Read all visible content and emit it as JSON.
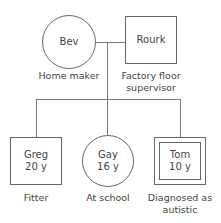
{
  "parents": [
    {
      "name": "Bev",
      "shape": "circle",
      "role": "Home maker",
      "role_lines": [
        "Home maker"
      ]
    },
    {
      "name": "Rourk",
      "shape": "square",
      "role": "Factory floor supervisor",
      "role_lines": [
        "Factory floor",
        "supervisor"
      ]
    }
  ],
  "children": [
    {
      "name": "Greg",
      "age": "20 y",
      "shape": "square",
      "role_lines": [
        "Fitter"
      ]
    },
    {
      "name": "Gay",
      "age": "16 y",
      "shape": "circle",
      "role_lines": [
        "At school"
      ]
    },
    {
      "name": "Tom",
      "age": "10 y",
      "shape": "double-square",
      "role_lines": [
        "Diagnosed as",
        "autistic"
      ]
    }
  ],
  "colors": {
    "line": "#777777",
    "text": "#444444",
    "background": "#ffffff"
  }
}
